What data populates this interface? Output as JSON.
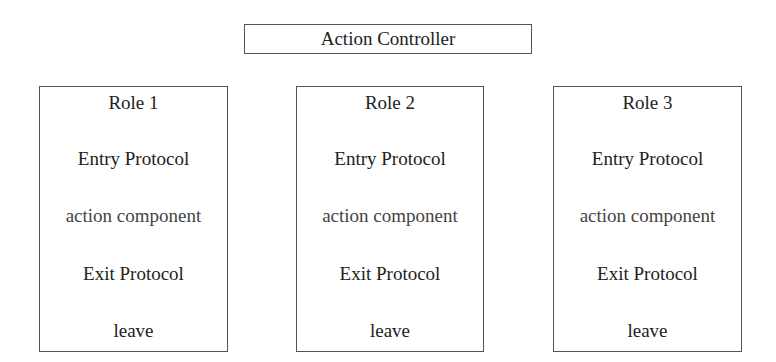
{
  "controller": {
    "label": "Action Controller"
  },
  "roles": [
    {
      "title": "Role 1",
      "entry": "Entry Protocol",
      "action": "action component",
      "exit": "Exit Protocol",
      "leave": "leave"
    },
    {
      "title": "Role 2",
      "entry": "Entry Protocol",
      "action": "action component",
      "exit": "Exit Protocol",
      "leave": "leave"
    },
    {
      "title": "Role 3",
      "entry": "Entry Protocol",
      "action": "action component",
      "exit": "Exit Protocol",
      "leave": "leave"
    }
  ]
}
